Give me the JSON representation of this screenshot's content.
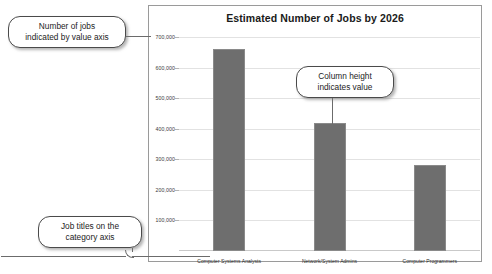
{
  "chart_data": {
    "type": "bar",
    "title": "Estimated Number of Jobs by 2026",
    "xlabel": "",
    "ylabel": "",
    "categories": [
      "Computer Systems Analysts",
      "Network/System Admins",
      "Computer Programmers"
    ],
    "values": [
      660000,
      420000,
      280000
    ],
    "ylim": [
      0,
      700000
    ],
    "ytick_labels": [
      "700,000",
      "600,000",
      "500,000",
      "400,000",
      "300,000",
      "200,000",
      "100,000"
    ],
    "ytick_values": [
      700000,
      600000,
      500000,
      400000,
      300000,
      200000,
      100000
    ],
    "grid": true,
    "legend": false,
    "series_color": "#6e6e6e",
    "annotations": [
      "Number of jobs indicated by value axis",
      "Column height indicates value",
      "Job titles on the category axis"
    ]
  },
  "callouts": {
    "value_axis": {
      "line1": "Number of jobs",
      "line2": "indicated by value axis"
    },
    "column_height": {
      "line1": "Column height",
      "line2": "indicates value"
    },
    "category_axis": {
      "line1": "Job titles on the",
      "line2": "category axis"
    }
  }
}
